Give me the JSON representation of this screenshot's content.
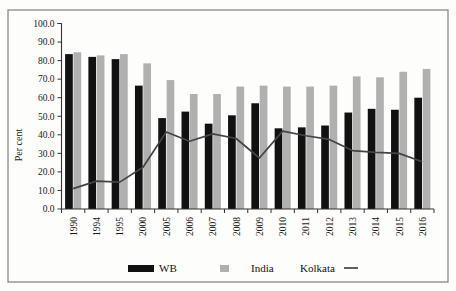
{
  "chart_data": {
    "type": "bar",
    "title": "",
    "xlabel": "",
    "ylabel": "Per cent",
    "ylim": [
      0,
      100
    ],
    "ytick_step": 10,
    "ytick_labels": [
      "0.0",
      "10.0",
      "20.0",
      "30.0",
      "40.0",
      "50.0",
      "60.0",
      "70.0",
      "80.0",
      "90.0",
      "100.0"
    ],
    "grid": false,
    "legend_position": "bottom",
    "categories": [
      "1990",
      "1994",
      "1995",
      "2000",
      "2005",
      "2006",
      "2007",
      "2008",
      "2009",
      "2010",
      "2011",
      "2012",
      "2013",
      "2014",
      "2015",
      "2016"
    ],
    "series": [
      {
        "name": "WB",
        "type": "bar",
        "color": "#111111",
        "values": [
          83.5,
          82.0,
          80.8,
          66.5,
          49.0,
          52.5,
          46.0,
          50.5,
          57.0,
          43.5,
          44.0,
          45.0,
          52.0,
          54.0,
          53.5,
          60.0
        ]
      },
      {
        "name": "India",
        "type": "bar",
        "color": "#b0b0b0",
        "values": [
          84.5,
          82.8,
          83.5,
          78.5,
          69.5,
          62.0,
          62.0,
          66.0,
          66.5,
          66.0,
          66.0,
          66.5,
          71.5,
          71.0,
          74.0,
          75.5
        ]
      },
      {
        "name": "Kolkata",
        "type": "line",
        "color": "#444444",
        "values": [
          11.0,
          15.0,
          14.5,
          22.5,
          41.5,
          36.5,
          40.5,
          38.0,
          27.5,
          42.0,
          39.5,
          37.5,
          31.5,
          30.5,
          30.0,
          25.5
        ]
      }
    ]
  },
  "legend": {
    "items": [
      {
        "label": "WB",
        "marker": "black-bar-swatch"
      },
      {
        "label": "India",
        "marker": "gray-bar-swatch"
      },
      {
        "label": "Kolkata",
        "marker": "line-swatch"
      }
    ]
  },
  "axes": {
    "y_title": "Per cent"
  }
}
